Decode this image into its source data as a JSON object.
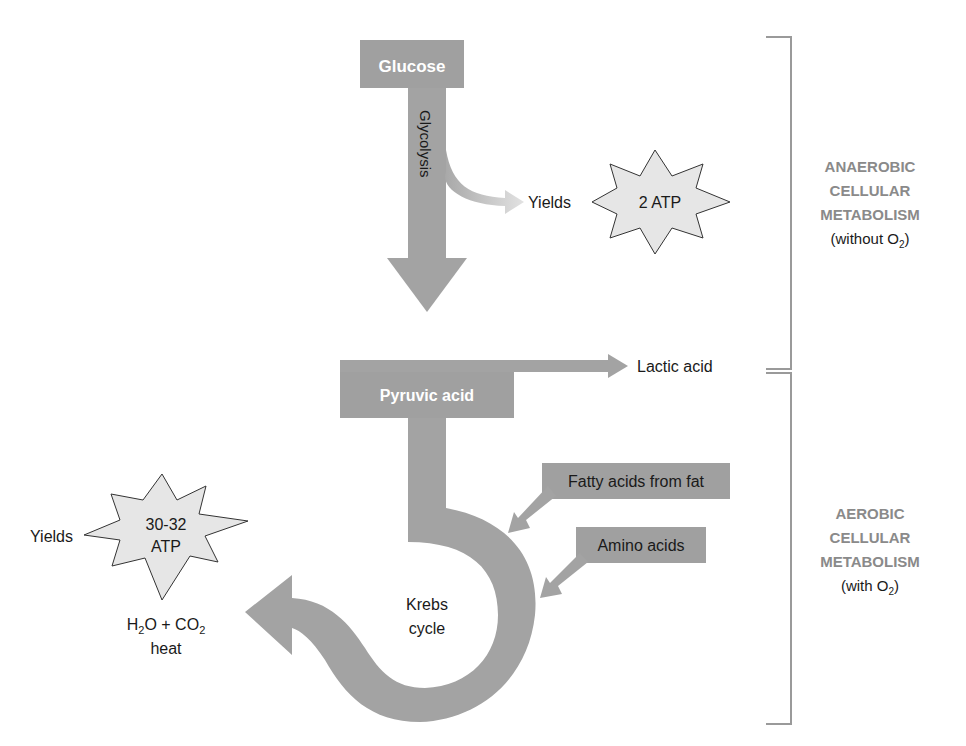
{
  "colors": {
    "arrow_fill": "#a3a3a3",
    "box_fill": "#a0a0a0",
    "starburst_fill": "#e6e6e6",
    "bracket": "#9a9a9a",
    "phase_text": "#8a8a8a",
    "text": "#1a1a1a"
  },
  "nodes": {
    "glucose": "Glucose",
    "glycolysis": "Glycolysis",
    "pyruvic_acid": "Pyruvic acid",
    "lactic_acid": "Lactic acid",
    "fatty_acids": "Fatty acids from fat",
    "amino_acids": "Amino acids",
    "krebs_line1": "Krebs",
    "krebs_line2": "cycle"
  },
  "yields": {
    "anaerobic": {
      "label": "Yields",
      "value": "2 ATP"
    },
    "aerobic": {
      "label": "Yields",
      "value_line1": "30-32",
      "value_line2": "ATP"
    }
  },
  "products": {
    "h2o_h": "H",
    "h2o_sub": "2",
    "h2o_o": "O + CO",
    "co2_sub": "2",
    "heat": "heat"
  },
  "phases": {
    "anaerobic": {
      "line1": "ANAEROBIC",
      "line2": "CELLULAR",
      "line3": "METABOLISM",
      "note_prefix": "(without O",
      "note_sub": "2",
      "note_suffix": ")"
    },
    "aerobic": {
      "line1": "AEROBIC",
      "line2": "CELLULAR",
      "line3": "METABOLISM",
      "note_prefix": "(with O",
      "note_sub": "2",
      "note_suffix": ")"
    }
  }
}
